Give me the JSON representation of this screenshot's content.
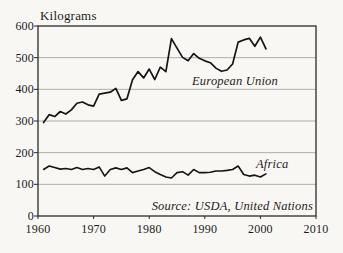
{
  "page": {
    "background": "#f8f7f4",
    "text_color": "#1c1c1c"
  },
  "chart_data": {
    "type": "line",
    "title": "Kilograms",
    "source_note": "Source: USDA, United Nations",
    "xlim": [
      1960,
      2010
    ],
    "ylim": [
      0,
      600
    ],
    "x_ticks": [
      1960,
      1970,
      1980,
      1990,
      2000,
      2010
    ],
    "y_ticks": [
      0,
      100,
      200,
      300,
      400,
      500,
      600
    ],
    "grid": "horizontal gridlines at each 100",
    "legend": "inline italic labels next to lines",
    "line_color": "#151515",
    "grid_color": "#9b9b97",
    "border_color": "#2b2b2b",
    "x": [
      1961,
      1962,
      1963,
      1964,
      1965,
      1966,
      1967,
      1968,
      1969,
      1970,
      1971,
      1972,
      1973,
      1974,
      1975,
      1976,
      1977,
      1978,
      1979,
      1980,
      1981,
      1982,
      1983,
      1984,
      1985,
      1986,
      1987,
      1988,
      1989,
      1990,
      1991,
      1992,
      1993,
      1994,
      1995,
      1996,
      1997,
      1998,
      1999,
      2000,
      2001
    ],
    "series": [
      {
        "name": "European Union",
        "values": [
          295,
          320,
          314,
          330,
          322,
          335,
          356,
          360,
          351,
          347,
          385,
          388,
          391,
          403,
          365,
          370,
          430,
          456,
          436,
          464,
          431,
          470,
          456,
          560,
          530,
          501,
          490,
          513,
          498,
          490,
          484,
          467,
          457,
          461,
          480,
          549,
          556,
          561,
          536,
          565,
          528
        ]
      },
      {
        "name": "Africa",
        "values": [
          147,
          158,
          153,
          148,
          150,
          147,
          153,
          147,
          150,
          147,
          155,
          126,
          147,
          152,
          147,
          152,
          137,
          142,
          147,
          153,
          140,
          131,
          123,
          120,
          137,
          140,
          129,
          147,
          137,
          137,
          138,
          142,
          142,
          144,
          147,
          158,
          131,
          126,
          129,
          123,
          133
        ]
      }
    ]
  }
}
